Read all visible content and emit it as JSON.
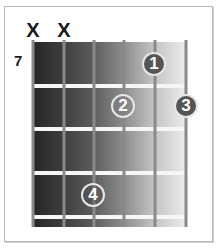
{
  "chord_diagram": {
    "start_fret_label": "7",
    "strings": 6,
    "frets_shown": 4,
    "muted_marker": "X",
    "muted_strings": [
      1,
      2
    ],
    "fingers": [
      {
        "label": "1",
        "string": 5,
        "fret": 1
      },
      {
        "label": "2",
        "string": 4,
        "fret": 2
      },
      {
        "label": "3",
        "string": 6,
        "fret": 2
      },
      {
        "label": "4",
        "string": 3,
        "fret": 4
      }
    ],
    "colors": {
      "board_dark": "#262626",
      "board_light": "#eeeeee",
      "fret_line": "#f6f6f6",
      "string": "#8a8a8a",
      "finger_fill": "#555555",
      "finger_text": "#ffffff"
    }
  }
}
